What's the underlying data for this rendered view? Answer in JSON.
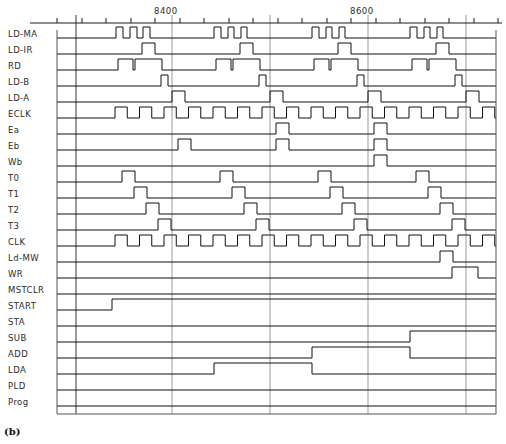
{
  "figure": {
    "caption": "(b)",
    "type": "digital-timing-diagram"
  },
  "axis": {
    "ticks": [
      {
        "label": "8400",
        "x": 172
      },
      {
        "label": "8600",
        "x": 368
      }
    ],
    "gridlines_x": [
      76,
      172,
      270,
      368,
      466
    ],
    "minor_tick_spacing": 24.5,
    "x_start": 57,
    "x_end": 496
  },
  "chart_data": {
    "type": "line",
    "title": "",
    "xlabel": "",
    "ylabel": "",
    "grid": true,
    "legend": "none",
    "x_range": [
      57,
      496
    ],
    "signals": [
      {
        "name": "LD-MA",
        "y": 38,
        "edges": [
          [
            57,
            0
          ],
          [
            110,
            0
          ],
          [
            116,
            1
          ],
          [
            123,
            0
          ],
          [
            130,
            1
          ],
          [
            137,
            0
          ],
          [
            143,
            1
          ],
          [
            150,
            0
          ],
          [
            208,
            0
          ],
          [
            214,
            1
          ],
          [
            221,
            0
          ],
          [
            228,
            1
          ],
          [
            234,
            0
          ],
          [
            241,
            1
          ],
          [
            247,
            0
          ],
          [
            306,
            0
          ],
          [
            312,
            1
          ],
          [
            319,
            0
          ],
          [
            326,
            1
          ],
          [
            332,
            0
          ],
          [
            339,
            1
          ],
          [
            345,
            0
          ],
          [
            404,
            0
          ],
          [
            410,
            1
          ],
          [
            417,
            0
          ],
          [
            424,
            1
          ],
          [
            430,
            0
          ],
          [
            437,
            1
          ],
          [
            443,
            0
          ],
          [
            496,
            0
          ]
        ]
      },
      {
        "name": "LD-IR",
        "y": 54,
        "edges": [
          [
            57,
            0
          ],
          [
            136,
            0
          ],
          [
            142,
            1
          ],
          [
            155,
            0
          ],
          [
            234,
            0
          ],
          [
            240,
            1
          ],
          [
            253,
            0
          ],
          [
            332,
            0
          ],
          [
            338,
            1
          ],
          [
            351,
            0
          ],
          [
            430,
            0
          ],
          [
            436,
            1
          ],
          [
            449,
            0
          ],
          [
            496,
            0
          ]
        ]
      },
      {
        "name": "RD",
        "y": 70,
        "edges": [
          [
            57,
            0
          ],
          [
            112,
            0
          ],
          [
            118,
            1
          ],
          [
            131,
            1
          ],
          [
            133,
            0
          ],
          [
            135,
            1
          ],
          [
            160,
            1
          ],
          [
            162,
            0
          ],
          [
            210,
            0
          ],
          [
            216,
            1
          ],
          [
            229,
            1
          ],
          [
            231,
            0
          ],
          [
            233,
            1
          ],
          [
            258,
            1
          ],
          [
            260,
            0
          ],
          [
            308,
            0
          ],
          [
            314,
            1
          ],
          [
            327,
            1
          ],
          [
            329,
            0
          ],
          [
            331,
            1
          ],
          [
            356,
            1
          ],
          [
            358,
            0
          ],
          [
            406,
            0
          ],
          [
            412,
            1
          ],
          [
            425,
            1
          ],
          [
            427,
            0
          ],
          [
            429,
            1
          ],
          [
            454,
            1
          ],
          [
            456,
            0
          ],
          [
            496,
            0
          ]
        ]
      },
      {
        "name": "LD-B",
        "y": 86,
        "edges": [
          [
            57,
            0
          ],
          [
            155,
            0
          ],
          [
            161,
            1
          ],
          [
            168,
            0
          ],
          [
            253,
            0
          ],
          [
            259,
            1
          ],
          [
            266,
            0
          ],
          [
            351,
            0
          ],
          [
            357,
            1
          ],
          [
            364,
            0
          ],
          [
            449,
            0
          ],
          [
            455,
            1
          ],
          [
            462,
            0
          ],
          [
            496,
            0
          ]
        ]
      },
      {
        "name": "LD-A",
        "y": 102,
        "edges": [
          [
            57,
            0
          ],
          [
            166,
            0
          ],
          [
            172,
            1
          ],
          [
            185,
            0
          ],
          [
            264,
            0
          ],
          [
            270,
            1
          ],
          [
            283,
            0
          ],
          [
            362,
            0
          ],
          [
            368,
            1
          ],
          [
            381,
            0
          ],
          [
            460,
            0
          ],
          [
            466,
            1
          ],
          [
            479,
            0
          ],
          [
            496,
            0
          ]
        ]
      },
      {
        "name": "ECLK",
        "y": 118,
        "edges": "clock",
        "clock_start": 115,
        "clock_period": 24.5,
        "clock_duty": 0.5
      },
      {
        "name": "Ea",
        "y": 134,
        "edges": [
          [
            57,
            0
          ],
          [
            270,
            0
          ],
          [
            276,
            1
          ],
          [
            289,
            0
          ],
          [
            368,
            0
          ],
          [
            374,
            1
          ],
          [
            387,
            0
          ],
          [
            496,
            0
          ]
        ]
      },
      {
        "name": "Eb",
        "y": 150,
        "edges": [
          [
            57,
            0
          ],
          [
            172,
            0
          ],
          [
            178,
            1
          ],
          [
            191,
            0
          ],
          [
            270,
            0
          ],
          [
            276,
            1
          ],
          [
            289,
            0
          ],
          [
            368,
            0
          ],
          [
            374,
            1
          ],
          [
            387,
            0
          ],
          [
            496,
            0
          ]
        ]
      },
      {
        "name": "Wb",
        "y": 166,
        "edges": [
          [
            57,
            0
          ],
          [
            368,
            0
          ],
          [
            374,
            1
          ],
          [
            387,
            0
          ],
          [
            496,
            0
          ]
        ]
      },
      {
        "name": "T0",
        "y": 182,
        "edges": [
          [
            57,
            0
          ],
          [
            116,
            0
          ],
          [
            122,
            1
          ],
          [
            135,
            0
          ],
          [
            214,
            0
          ],
          [
            220,
            1
          ],
          [
            233,
            0
          ],
          [
            312,
            0
          ],
          [
            318,
            1
          ],
          [
            331,
            0
          ],
          [
            410,
            0
          ],
          [
            416,
            1
          ],
          [
            429,
            0
          ],
          [
            496,
            0
          ]
        ]
      },
      {
        "name": "T1",
        "y": 198,
        "edges": [
          [
            57,
            0
          ],
          [
            128,
            0
          ],
          [
            134,
            1
          ],
          [
            147,
            0
          ],
          [
            226,
            0
          ],
          [
            232,
            1
          ],
          [
            245,
            0
          ],
          [
            324,
            0
          ],
          [
            330,
            1
          ],
          [
            343,
            0
          ],
          [
            422,
            0
          ],
          [
            428,
            1
          ],
          [
            441,
            0
          ],
          [
            496,
            0
          ]
        ]
      },
      {
        "name": "T2",
        "y": 214,
        "edges": [
          [
            57,
            0
          ],
          [
            140,
            0
          ],
          [
            146,
            1
          ],
          [
            159,
            0
          ],
          [
            238,
            0
          ],
          [
            244,
            1
          ],
          [
            257,
            0
          ],
          [
            336,
            0
          ],
          [
            342,
            1
          ],
          [
            355,
            0
          ],
          [
            434,
            0
          ],
          [
            440,
            1
          ],
          [
            453,
            0
          ],
          [
            496,
            0
          ]
        ]
      },
      {
        "name": "T3",
        "y": 230,
        "edges": [
          [
            57,
            0
          ],
          [
            152,
            0
          ],
          [
            158,
            1
          ],
          [
            171,
            0
          ],
          [
            250,
            0
          ],
          [
            256,
            1
          ],
          [
            269,
            0
          ],
          [
            348,
            0
          ],
          [
            354,
            1
          ],
          [
            367,
            0
          ],
          [
            446,
            0
          ],
          [
            452,
            1
          ],
          [
            465,
            0
          ],
          [
            496,
            0
          ]
        ]
      },
      {
        "name": "CLK",
        "y": 246,
        "edges": "clock",
        "clock_start": 115,
        "clock_period": 24.5,
        "clock_duty": 0.5
      },
      {
        "name": "Ld-MW",
        "y": 262,
        "edges": [
          [
            57,
            0
          ],
          [
            434,
            0
          ],
          [
            440,
            1
          ],
          [
            453,
            0
          ],
          [
            496,
            0
          ]
        ]
      },
      {
        "name": "WR",
        "y": 278,
        "edges": [
          [
            57,
            0
          ],
          [
            446,
            0
          ],
          [
            452,
            1
          ],
          [
            478,
            0
          ],
          [
            496,
            0
          ]
        ]
      },
      {
        "name": "MSTCLR",
        "y": 294,
        "edges": [
          [
            57,
            0
          ],
          [
            496,
            0
          ]
        ]
      },
      {
        "name": "START",
        "y": 310,
        "edges": [
          [
            57,
            0
          ],
          [
            106,
            0
          ],
          [
            112,
            1
          ],
          [
            496,
            1
          ]
        ]
      },
      {
        "name": "STA",
        "y": 326,
        "edges": [
          [
            57,
            0
          ],
          [
            496,
            0
          ]
        ]
      },
      {
        "name": "SUB",
        "y": 342,
        "edges": [
          [
            57,
            0
          ],
          [
            404,
            0
          ],
          [
            410,
            1
          ],
          [
            496,
            1
          ]
        ]
      },
      {
        "name": "ADD",
        "y": 358,
        "edges": [
          [
            57,
            0
          ],
          [
            306,
            0
          ],
          [
            312,
            1
          ],
          [
            404,
            1
          ],
          [
            410,
            0
          ],
          [
            496,
            0
          ]
        ]
      },
      {
        "name": "LDA",
        "y": 374,
        "edges": [
          [
            57,
            0
          ],
          [
            208,
            0
          ],
          [
            214,
            1
          ],
          [
            306,
            1
          ],
          [
            312,
            0
          ],
          [
            496,
            0
          ]
        ]
      },
      {
        "name": "PLD",
        "y": 390,
        "edges": [
          [
            57,
            0
          ],
          [
            496,
            0
          ]
        ]
      },
      {
        "name": "Prog",
        "y": 406,
        "edges": [
          [
            57,
            0
          ],
          [
            496,
            0
          ]
        ]
      }
    ]
  }
}
